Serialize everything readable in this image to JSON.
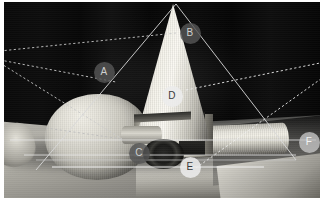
{
  "scene": {
    "title": "Perspective annotation overlay on still-life photograph",
    "background_color": "#070707",
    "page_margin_color": "#ffffff"
  },
  "markers": [
    {
      "id": "A",
      "label": "A",
      "x": 104,
      "y": 72,
      "style": "dark",
      "target": "left-vanishing-ray-junction"
    },
    {
      "id": "B",
      "label": "B",
      "x": 190,
      "y": 33,
      "style": "dark",
      "target": "cone-upper-right-edge"
    },
    {
      "id": "C",
      "label": "C",
      "x": 139,
      "y": 153,
      "style": "dark",
      "target": "dark-disc-center"
    },
    {
      "id": "D",
      "label": "D",
      "x": 172,
      "y": 96,
      "style": "light",
      "target": "cone-body-center"
    },
    {
      "id": "E",
      "label": "E",
      "x": 190,
      "y": 167,
      "style": "light",
      "target": "table-horizon-line"
    },
    {
      "id": "F",
      "label": "F",
      "x": 309,
      "y": 142,
      "style": "lightgray",
      "target": "right-vanishing-point"
    }
  ],
  "lines": {
    "solid": [
      {
        "name": "cone-left-projection",
        "x1": 176,
        "y1": 4,
        "x2": 36,
        "y2": 170,
        "color": "#d8d8d8",
        "width": 0.9
      },
      {
        "name": "cone-right-projection",
        "x1": 176,
        "y1": 4,
        "x2": 296,
        "y2": 160,
        "color": "#d8d8d8",
        "width": 0.9
      },
      {
        "name": "horizon-upper",
        "x1": 10,
        "y1": 140,
        "x2": 316,
        "y2": 140,
        "color": "#e8e8e8",
        "width": 0.8
      },
      {
        "name": "horizon-lower",
        "x1": 24,
        "y1": 155,
        "x2": 296,
        "y2": 155,
        "color": "#e8e8e8",
        "width": 0.8
      },
      {
        "name": "baseline",
        "x1": 52,
        "y1": 167,
        "x2": 264,
        "y2": 167,
        "color": "#f0f0f0",
        "width": 1.1
      },
      {
        "name": "right-base-edge",
        "x1": 296,
        "y1": 160,
        "x2": 36,
        "y2": 160,
        "color": "#cccccc",
        "width": 0.7
      }
    ],
    "dashed": [
      {
        "name": "vp-left-ray-1",
        "x1": 0,
        "y1": 51,
        "x2": 176,
        "y2": 33,
        "color": "#c9c9c9"
      },
      {
        "name": "vp-left-ray-2",
        "x1": 0,
        "y1": 60,
        "x2": 116,
        "y2": 82,
        "color": "#c9c9c9"
      },
      {
        "name": "vp-left-ray-3",
        "x1": 0,
        "y1": 63,
        "x2": 122,
        "y2": 139,
        "color": "#c9c9c9"
      },
      {
        "name": "sphere-axis",
        "x1": 46,
        "y1": 128,
        "x2": 122,
        "y2": 139,
        "color": "#bdbdbd"
      },
      {
        "name": "vp-right-ray-1",
        "x1": 186,
        "y1": 90,
        "x2": 325,
        "y2": 62,
        "color": "#efefef"
      },
      {
        "name": "vp-right-ray-2",
        "x1": 325,
        "y1": 76,
        "x2": 196,
        "y2": 168,
        "color": "#efefef"
      }
    ]
  },
  "shapes": [
    {
      "name": "cone",
      "kind": "cone",
      "apex_x": 176,
      "apex_y": 4
    },
    {
      "name": "sphere",
      "kind": "sphere"
    },
    {
      "name": "cylinder",
      "kind": "cylinder"
    },
    {
      "name": "dark-disc",
      "kind": "disc"
    }
  ]
}
